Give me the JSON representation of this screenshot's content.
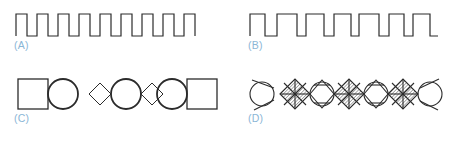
{
  "figure": {
    "background_color": "#ffffff",
    "stroke_color": "#2b2b2b",
    "label_color": "#8ab6d6",
    "width": 467,
    "height": 144,
    "panel_count": 4
  },
  "panels": [
    {
      "id": "A",
      "label": "(A)",
      "kind": "square-wave",
      "description": "Regular square wave, uniform pulse width and spacing",
      "pulse_count": 9,
      "amplitude": 22,
      "pulse_width": 11,
      "gap_width": 10,
      "baseline_y": 36,
      "start_x": 16,
      "stroke_width": 1.2
    },
    {
      "id": "B",
      "label": "(B)",
      "kind": "square-wave",
      "description": "Irregular square wave, varying pulse widths and gaps",
      "pulse_count": 7,
      "amplitude": 22,
      "baseline_y": 36,
      "start_x": 16,
      "stroke_width": 1.2,
      "pulse_widths": [
        15,
        20,
        18,
        17,
        20,
        15,
        17
      ],
      "gap_widths": [
        12,
        9,
        10,
        8,
        10,
        9,
        8
      ]
    },
    {
      "id": "C",
      "label": "(C)",
      "kind": "shape-chain",
      "description": "Chain of alternating squares, circles and diamonds, outlines only",
      "shape_count": 7,
      "shapes": [
        "square",
        "circle",
        "diamond",
        "circle",
        "diamond",
        "circle",
        "square"
      ],
      "sizes": [
        30,
        30,
        22,
        30,
        22,
        30,
        30
      ],
      "center_y": 26,
      "start_x": 18,
      "stroke_width": 1.3
    },
    {
      "id": "D",
      "label": "(D)",
      "kind": "shape-chain",
      "description": "Overlapping chain of circles and cross-hatched diamonds",
      "shape_count": 7,
      "shapes": [
        "circle",
        "diamond-hatched",
        "circle",
        "diamond-hatched",
        "circle",
        "diamond-hatched",
        "circle"
      ],
      "sizes": [
        24,
        30,
        24,
        30,
        24,
        30,
        24
      ],
      "center_y": 26,
      "start_x": 16,
      "stroke_width": 1.2,
      "hatch_spacing": 2.2,
      "diamond_has_diagonals": true
    }
  ]
}
